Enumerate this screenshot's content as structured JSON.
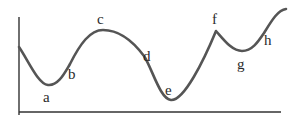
{
  "diagram": {
    "type": "curve-with-labeled-points",
    "colors": {
      "curve": "#555555",
      "axis": "#333333",
      "label": "#2a2a2a",
      "background": "#ffffff"
    },
    "points": [
      {
        "id": "a",
        "label": "a",
        "kind": "local minimum"
      },
      {
        "id": "b",
        "label": "b",
        "kind": "rising slope"
      },
      {
        "id": "c",
        "label": "c",
        "kind": "local maximum"
      },
      {
        "id": "d",
        "label": "d",
        "kind": "falling slope"
      },
      {
        "id": "e",
        "label": "e",
        "kind": "global minimum"
      },
      {
        "id": "f",
        "label": "f",
        "kind": "cusp / local maximum"
      },
      {
        "id": "g",
        "label": "g",
        "kind": "local minimum"
      },
      {
        "id": "h",
        "label": "h",
        "kind": "rising slope"
      }
    ]
  }
}
